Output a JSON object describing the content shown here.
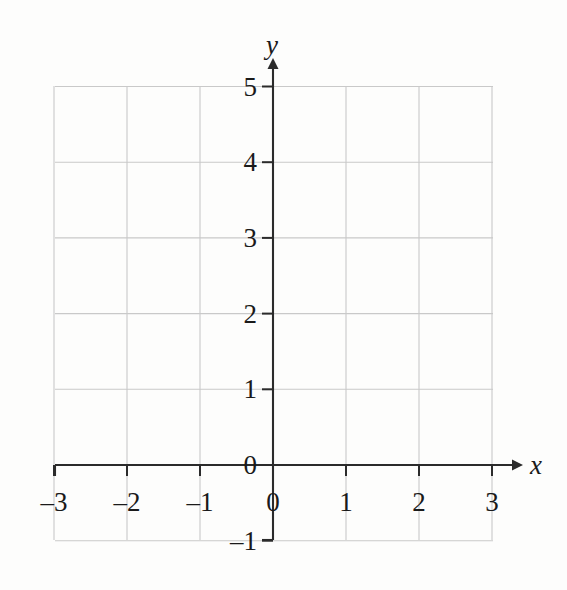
{
  "figure": {
    "kind": "blank-coordinate-grid",
    "background_color": "#fdfdfc",
    "grid_color": "#c9c9c9",
    "axis_color": "#2b2b2b",
    "text_color": "#1a1a1a"
  },
  "axes": {
    "x_axis_label": "x",
    "y_axis_label": "y",
    "x_axis_name": "x-axis",
    "y_axis_name": "y-axis",
    "x_tick_labels": [
      "-3",
      "-2",
      "-1",
      "0",
      "1",
      "2",
      "3"
    ],
    "y_tick_labels": [
      "5",
      "4",
      "3",
      "2",
      "1",
      "0",
      "-1"
    ]
  },
  "chart_data": {
    "type": "scatter",
    "title": "",
    "subtitle": "",
    "xlabel": "x",
    "ylabel": "y",
    "xlim": [
      -3,
      3
    ],
    "ylim": [
      -1,
      5
    ],
    "xticks": [
      -3,
      -2,
      -1,
      0,
      1,
      2,
      3
    ],
    "yticks": [
      -1,
      0,
      1,
      2,
      3,
      4,
      5
    ],
    "xtick_labels": [
      "-3",
      "-2",
      "-1",
      "0",
      "1",
      "2",
      "3"
    ],
    "ytick_labels": [
      "-1",
      "0",
      "1",
      "2",
      "3",
      "4",
      "5"
    ],
    "grid": true,
    "grid_spacing_x": 1,
    "grid_spacing_y": 1,
    "legend": null,
    "legend_position": "none",
    "annotations": [],
    "series": [],
    "x": [],
    "values": []
  },
  "geometry": {
    "plot_left_px": 55,
    "plot_right_px": 493,
    "plot_top_px": 86,
    "plot_bottom_px": 540,
    "origin_x_px": 273,
    "origin_y_px": 465,
    "unit_x_px": 73,
    "unit_y_px": 75.7
  }
}
